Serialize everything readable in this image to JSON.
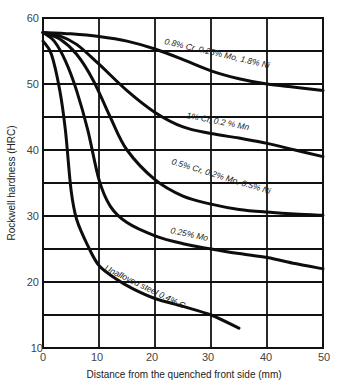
{
  "chart_data": {
    "type": "line",
    "title": "",
    "xlabel": "Distance from the quenched front side (mm)",
    "ylabel": "Rockwell hardness (HRC)",
    "xlim": [
      0,
      50
    ],
    "ylim": [
      10,
      60
    ],
    "x_ticks": [
      "0",
      "10",
      "20",
      "30",
      "40",
      "50"
    ],
    "y_ticks": [
      "10",
      "20",
      "30",
      "40",
      "50",
      "60"
    ],
    "grid": true,
    "legend": "inline labels on curves",
    "series": [
      {
        "name": "0.8% Cr, 0.25% Mo, 1.8% Ni",
        "x": [
          0,
          5,
          10,
          15,
          20,
          25,
          30,
          35,
          40,
          45,
          50
        ],
        "y": [
          57.8,
          57.6,
          57.2,
          56.5,
          55.3,
          53.7,
          52.0,
          50.8,
          50.0,
          49.5,
          49.0
        ]
      },
      {
        "name": "1% Cr, 0.2 % Mn",
        "x": [
          0,
          3,
          6,
          10,
          15,
          20,
          25,
          30,
          35,
          40,
          45,
          50
        ],
        "y": [
          57.8,
          57.3,
          56.0,
          53.0,
          49.0,
          45.7,
          43.5,
          42.5,
          41.8,
          41.0,
          40.0,
          39.0
        ]
      },
      {
        "name": "0.5% Cr, 0.2% Mo, 0.5% Ni",
        "x": [
          0,
          3,
          6,
          9,
          12,
          15,
          20,
          25,
          30,
          35,
          40,
          45,
          50
        ],
        "y": [
          57.8,
          56.8,
          54.5,
          50.5,
          45.0,
          40.0,
          35.5,
          33.0,
          31.8,
          31.0,
          30.6,
          30.3,
          30.1
        ]
      },
      {
        "name": "0.25% Mo",
        "x": [
          0,
          2,
          4,
          6,
          8,
          10,
          12,
          15,
          20,
          25,
          30,
          35,
          40,
          45,
          50
        ],
        "y": [
          57.8,
          56.5,
          53.5,
          49.0,
          43.0,
          35.5,
          31.5,
          29.0,
          27.0,
          25.8,
          25.0,
          24.3,
          23.7,
          22.8,
          22.0
        ]
      },
      {
        "name": "Unalloyed steel 0.4% C",
        "x": [
          0,
          1.5,
          3,
          4,
          5,
          6,
          8,
          10,
          13,
          16,
          20,
          25,
          30,
          35
        ],
        "y": [
          56.5,
          54.5,
          49.0,
          43.0,
          34.0,
          29.5,
          25.5,
          22.5,
          20.5,
          19.0,
          17.5,
          16.3,
          15.0,
          13.0
        ]
      }
    ],
    "annotations": [
      "0.8% Cr, 0.25% Mo, 1.8% Ni",
      "1% Cr, 0.2 % Mn",
      "0.5% Cr, 0.2% Mo, 0.5% Ni",
      "0.25% Mo",
      "Unalloyed steel 0.4% C"
    ]
  },
  "axes": {
    "xlabel": "Distance from the quenched front side (mm)",
    "ylabel": "Rockwell hardness (HRC)",
    "x_ticks": [
      "0",
      "10",
      "20",
      "30",
      "40",
      "50"
    ],
    "y_ticks": [
      "10",
      "20",
      "30",
      "40",
      "50",
      "60"
    ]
  },
  "labels": {
    "s0": "0.8% Cr, 0.25% Mo, 1.8% Ni",
    "s1": "1% Cr, 0.2 % Mn",
    "s2": "0.5% Cr, 0.2% Mo, 0.5% Ni",
    "s3": "0.25% Mo",
    "s4": "Unalloyed steel 0.4% C"
  }
}
